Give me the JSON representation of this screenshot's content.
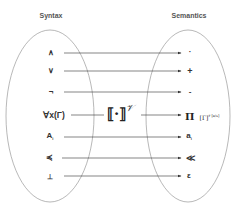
{
  "headers": {
    "left": "Syntax",
    "right": "Semantics"
  },
  "mapping": {
    "operator": "⟦·⟧",
    "superscript": "𝒱"
  },
  "rows": [
    {
      "syntax": "∧",
      "semantics": "·"
    },
    {
      "syntax": "∨",
      "semantics": "+"
    },
    {
      "syntax": "¬",
      "semantics": "-"
    },
    {
      "syntax": "∀x(Γ)",
      "semantics": "Π",
      "semantics_extra": "[Γ]",
      "semantics_extra_sup": "𝒱[a/x]"
    },
    {
      "syntax": "A",
      "syntax_sub": "i",
      "semantics": "a",
      "semantics_sub": "i"
    },
    {
      "syntax": "≼",
      "semantics": "≪"
    },
    {
      "syntax": "⊥",
      "semantics": "ε"
    }
  ],
  "colors": {
    "line": "#333333",
    "ellipse": "#888888",
    "header": "#555555",
    "symbol": "#333333"
  }
}
